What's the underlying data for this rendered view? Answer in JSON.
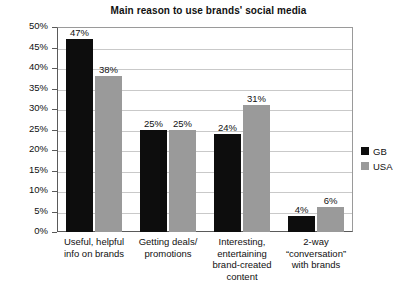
{
  "chart_data": {
    "type": "bar",
    "title": "Main reason to use brands' social media",
    "xlabel": "",
    "ylabel": "",
    "ylim": [
      0,
      50
    ],
    "grid": true,
    "legend_position": "right",
    "y_ticks": [
      "0%",
      "5%",
      "10%",
      "15%",
      "20%",
      "25%",
      "30%",
      "35%",
      "40%",
      "45%",
      "50%"
    ],
    "y_tick_values": [
      0,
      5,
      10,
      15,
      20,
      25,
      30,
      35,
      40,
      45,
      50
    ],
    "categories": [
      "Useful, helpful\ninfo on brands",
      "Getting deals/\npromotions",
      "Interesting,\nentertaining\nbrand-created\ncontent",
      "2-way\n“conversation”\nwith brands"
    ],
    "category_lines": [
      [
        "Useful, helpful",
        "info on brands"
      ],
      [
        "Getting deals/",
        "promotions"
      ],
      [
        "Interesting,",
        "entertaining",
        "brand-created",
        "content"
      ],
      [
        "2-way",
        "“conversation”",
        "with brands"
      ]
    ],
    "series": [
      {
        "name": "GB",
        "color": "#0d0d0d",
        "values": [
          47,
          25,
          24,
          4
        ],
        "labels": [
          "47%",
          "25%",
          "24%",
          "4%"
        ]
      },
      {
        "name": "USA",
        "color": "#9a9a9a",
        "values": [
          38,
          25,
          31,
          6
        ],
        "labels": [
          "38%",
          "25%",
          "31%",
          "6%"
        ]
      }
    ]
  },
  "legend": {
    "items": [
      {
        "label": "GB",
        "color": "#0d0d0d"
      },
      {
        "label": "USA",
        "color": "#9a9a9a"
      }
    ]
  }
}
